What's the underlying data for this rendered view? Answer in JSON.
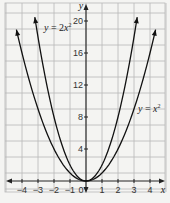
{
  "chart_data": {
    "type": "line",
    "title": "",
    "xlabel": "x",
    "ylabel": "y",
    "xlim": [
      -5,
      5
    ],
    "ylim": [
      -1,
      22
    ],
    "grid": true,
    "x_ticks": [
      "-4",
      "-3",
      "-2",
      "-1",
      "0",
      "1",
      "2",
      "3",
      "4"
    ],
    "y_ticks": [
      "4",
      "8",
      "12",
      "16",
      "20"
    ],
    "series": [
      {
        "name": "y = 2x²",
        "label_parts": {
          "lhs": "y",
          "eq": " = 2",
          "var": "x",
          "exp": "2"
        },
        "x": [
          -3.2,
          -3,
          -2,
          -1,
          0,
          1,
          2,
          3,
          3.2
        ],
        "values": [
          20.48,
          18,
          8,
          2,
          0,
          2,
          8,
          18,
          20.48
        ]
      },
      {
        "name": "y = x²",
        "label_parts": {
          "lhs": "y",
          "eq": " = ",
          "var": "x",
          "exp": "2"
        },
        "x": [
          -4.35,
          -4,
          -3,
          -2,
          -1,
          0,
          1,
          2,
          3,
          4,
          4.35
        ],
        "values": [
          18.9,
          16,
          9,
          4,
          1,
          0,
          1,
          4,
          9,
          16,
          18.9
        ]
      }
    ],
    "annotations": [
      {
        "text": "y = 2x²",
        "x": -2.4,
        "y": 19
      },
      {
        "text": "y = x²",
        "x": 3.4,
        "y": 9
      }
    ]
  }
}
